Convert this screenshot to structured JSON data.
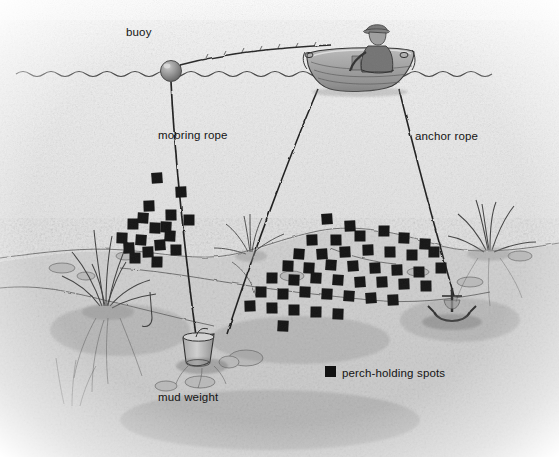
{
  "illustration": {
    "title_alt": "Perch fishing over a weedy flat from an anchored rowboat",
    "style": "pencil-sketch",
    "palette": {
      "paper": "#ffffff",
      "water_light": "#e9e9e9",
      "water_mid": "#dcdcdc",
      "bed_gray": "#c9c9c9",
      "ink": "#1a1a1a",
      "spot_black": "#111111",
      "boat_gray": "#9a9a9a",
      "buoy_gray": "#8e8e8e"
    },
    "waterline_y": 73
  },
  "labels": {
    "buoy": {
      "text": "buoy",
      "x": 126,
      "y": 27
    },
    "mooring_rope": {
      "text": "mooring rope",
      "x": 158,
      "y": 130
    },
    "anchor_rope": {
      "text": "anchor rope",
      "x": 415,
      "y": 131
    },
    "mud_weight": {
      "text": "mud weight",
      "x": 158,
      "y": 392
    },
    "legend": {
      "text": "perch-holding spots",
      "x": 342,
      "y": 368,
      "swatch_x": 325,
      "swatch_y": 366
    }
  },
  "objects": {
    "buoy": {
      "name": "buoy",
      "cx": 171,
      "cy": 71,
      "r": 10
    },
    "boat": {
      "name": "rowboat",
      "x": 305,
      "y": 50,
      "w": 105,
      "h": 42
    },
    "fisherman": {
      "name": "seated-angler",
      "x": 370,
      "y": 26
    },
    "mud_weight": {
      "name": "mud-weight",
      "x": 190,
      "y": 340
    },
    "anchor": {
      "name": "anchor",
      "x": 452,
      "y": 300
    },
    "grass_left": {
      "name": "grass-clump-left",
      "x": 105,
      "y": 300
    },
    "grass_right": {
      "name": "grass-clump-right",
      "x": 483,
      "y": 228
    },
    "weed_mid": {
      "name": "weed-clump-mid",
      "x": 248,
      "y": 232
    }
  },
  "ropes": {
    "mooring_surface": {
      "from": [
        181,
        66
      ],
      "to": [
        330,
        46
      ]
    },
    "mooring_sunk": {
      "from": [
        171,
        82
      ],
      "to": [
        196,
        340
      ]
    },
    "anchor_line": {
      "from": [
        399,
        88
      ],
      "to": [
        455,
        300
      ]
    },
    "boat_bow_line": {
      "from": [
        318,
        88
      ],
      "to": [
        226,
        337
      ]
    }
  },
  "chart_data": {
    "type": "scatter",
    "title": "perch-holding spots",
    "legend": [
      "perch-holding spots"
    ],
    "marker": "filled-square",
    "marker_color": "#111111",
    "marker_size": 11,
    "clusters": [
      {
        "name": "left-slope-cluster",
        "count": 18,
        "points": [
          [
            157,
            178
          ],
          [
            181,
            192
          ],
          [
            149,
            206
          ],
          [
            171,
            215
          ],
          [
            189,
            220
          ],
          [
            133,
            224
          ],
          [
            155,
            228
          ],
          [
            170,
            236
          ],
          [
            141,
            240
          ],
          [
            160,
            245
          ],
          [
            129,
            248
          ],
          [
            148,
            252
          ],
          [
            176,
            250
          ],
          [
            135,
            258
          ],
          [
            157,
            262
          ],
          [
            122,
            238
          ],
          [
            166,
            227
          ],
          [
            143,
            218
          ]
        ]
      },
      {
        "name": "main-flat-cluster",
        "count": 44,
        "points": [
          [
            327,
            219
          ],
          [
            350,
            226
          ],
          [
            312,
            240
          ],
          [
            336,
            240
          ],
          [
            360,
            236
          ],
          [
            384,
            231
          ],
          [
            404,
            238
          ],
          [
            425,
            244
          ],
          [
            299,
            254
          ],
          [
            322,
            254
          ],
          [
            345,
            252
          ],
          [
            368,
            250
          ],
          [
            390,
            252
          ],
          [
            412,
            255
          ],
          [
            434,
            252
          ],
          [
            288,
            266
          ],
          [
            309,
            268
          ],
          [
            331,
            265
          ],
          [
            353,
            266
          ],
          [
            375,
            268
          ],
          [
            397,
            270
          ],
          [
            419,
            272
          ],
          [
            441,
            268
          ],
          [
            272,
            278
          ],
          [
            294,
            280
          ],
          [
            316,
            278
          ],
          [
            338,
            280
          ],
          [
            360,
            282
          ],
          [
            382,
            282
          ],
          [
            404,
            284
          ],
          [
            426,
            286
          ],
          [
            261,
            292
          ],
          [
            283,
            294
          ],
          [
            305,
            292
          ],
          [
            327,
            294
          ],
          [
            349,
            296
          ],
          [
            371,
            298
          ],
          [
            393,
            300
          ],
          [
            250,
            306
          ],
          [
            272,
            308
          ],
          [
            294,
            310
          ],
          [
            316,
            312
          ],
          [
            338,
            314
          ],
          [
            283,
            326
          ]
        ]
      }
    ]
  }
}
